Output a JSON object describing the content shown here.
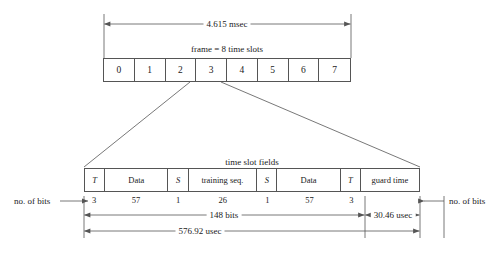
{
  "figure": {
    "background_color": "#ffffff",
    "line_color": "#555555",
    "text_color": "#1a1a1a"
  },
  "frame": {
    "duration_label": "4.615 msec",
    "caption": "frame = 8 time slots",
    "slots": [
      "0",
      "1",
      "2",
      "3",
      "4",
      "5",
      "6",
      "7"
    ],
    "expanded_slot": "3"
  },
  "timeslot": {
    "caption": "time slot fields",
    "fields": [
      {
        "label": "T",
        "italic": true,
        "bits": "3"
      },
      {
        "label": "Data",
        "italic": false,
        "bits": "57"
      },
      {
        "label": "S",
        "italic": true,
        "bits": "1"
      },
      {
        "label": "training seq.",
        "italic": false,
        "bits": "26"
      },
      {
        "label": "S",
        "italic": true,
        "bits": "1"
      },
      {
        "label": "Data",
        "italic": false,
        "bits": "57"
      },
      {
        "label": "T",
        "italic": true,
        "bits": "3"
      },
      {
        "label": "guard time",
        "italic": false,
        "bits": ""
      }
    ],
    "bits_label_left": "no. of bits",
    "bits_label_right": "no. of bits",
    "dimensions": {
      "payload": "148 bits",
      "guard": "30.46 usec",
      "total": "576.92 usec"
    }
  }
}
